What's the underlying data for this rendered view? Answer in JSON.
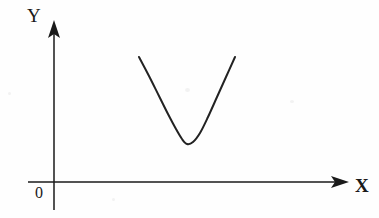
{
  "figure": {
    "background_color": "#fefefe",
    "stroke_color": "#1a1a1a",
    "curve_color": "#222222",
    "width": 379,
    "height": 218
  },
  "labels": {
    "y_axis": "Y",
    "x_axis": "X",
    "origin": "0"
  },
  "icons": {
    "y_axis_arrow": "arrow-up-icon",
    "x_axis_arrow": "arrow-right-icon"
  },
  "chart_data": {
    "type": "line",
    "title": "",
    "subtitle": "",
    "xlabel": "X",
    "ylabel": "Y",
    "grid": false,
    "legend": null,
    "annotations": [
      {
        "text": "0",
        "role": "origin-label",
        "x": 0,
        "y": 0
      },
      {
        "text": "Y",
        "role": "y-axis-label"
      },
      {
        "text": "X",
        "role": "x-axis-label"
      }
    ],
    "axes": {
      "origin_px": {
        "x": 54,
        "y": 182
      },
      "x_axis_px": {
        "from_x": 28,
        "to_x": 349,
        "y": 182,
        "arrow": "right"
      },
      "y_axis_px": {
        "x": 54,
        "from_y": 210,
        "to_y": 20,
        "arrow": "up"
      }
    },
    "series": [
      {
        "name": "parabola",
        "shape": "upward-opening parabola (U curve)",
        "vertex_px": {
          "x": 187,
          "y": 144
        },
        "left_endpoint_px": {
          "x": 139,
          "y": 57
        },
        "right_endpoint_px": {
          "x": 235,
          "y": 57
        },
        "points_px": [
          {
            "x": 139,
            "y": 57
          },
          {
            "x": 149,
            "y": 76
          },
          {
            "x": 159,
            "y": 96
          },
          {
            "x": 168,
            "y": 114
          },
          {
            "x": 176,
            "y": 129
          },
          {
            "x": 182,
            "y": 139
          },
          {
            "x": 187,
            "y": 144
          },
          {
            "x": 193,
            "y": 142
          },
          {
            "x": 200,
            "y": 133
          },
          {
            "x": 208,
            "y": 117
          },
          {
            "x": 217,
            "y": 97
          },
          {
            "x": 226,
            "y": 77
          },
          {
            "x": 235,
            "y": 57
          }
        ]
      }
    ]
  }
}
